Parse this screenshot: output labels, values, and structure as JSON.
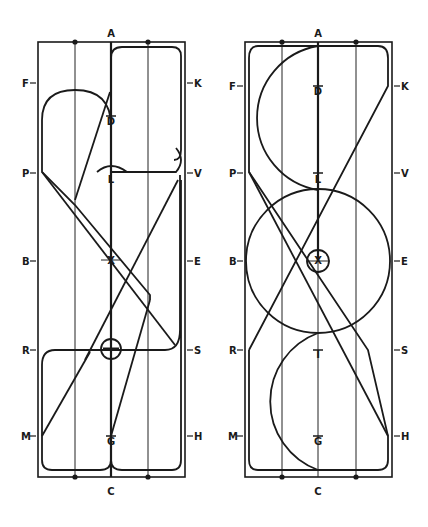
{
  "diagrams": [
    {
      "id": "left",
      "letters": {
        "top": "A",
        "bottom": "C",
        "left": [
          "F",
          "P",
          "B",
          "R",
          "M"
        ],
        "right": [
          "K",
          "V",
          "E",
          "S",
          "H"
        ],
        "center": [
          "D",
          "L",
          "X",
          "I",
          "G"
        ]
      }
    },
    {
      "id": "right",
      "letters": {
        "top": "A",
        "bottom": "C",
        "left": [
          "F",
          "P",
          "B",
          "R",
          "M"
        ],
        "right": [
          "K",
          "V",
          "E",
          "S",
          "H"
        ],
        "center": [
          "D",
          "L",
          "X",
          "I",
          "G"
        ]
      }
    }
  ],
  "colors": {
    "line": "#1a1a1a",
    "background": "#ffffff"
  }
}
